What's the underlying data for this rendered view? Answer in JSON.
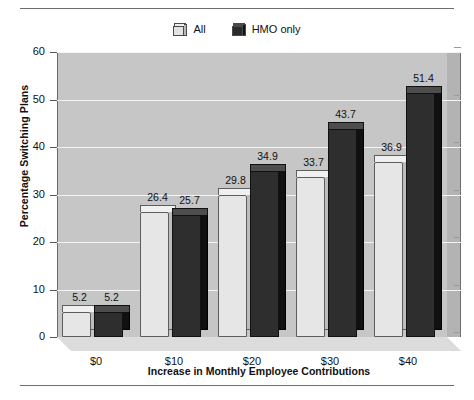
{
  "chart_data": {
    "type": "bar",
    "title": "",
    "xlabel": "Increase in Monthly Employee Contributions",
    "ylabel": "Percentage Switching Plans",
    "categories": [
      "$0",
      "$10",
      "$20",
      "$30",
      "$40"
    ],
    "series": [
      {
        "name": "All",
        "values": [
          5.2,
          26.4,
          29.8,
          33.7,
          36.9
        ],
        "color": "#e6e6e6"
      },
      {
        "name": "HMO only",
        "values": [
          5.2,
          25.7,
          34.9,
          43.7,
          51.4
        ],
        "color": "#2e2e2e"
      }
    ],
    "ylim": [
      0,
      60
    ],
    "yticks": [
      0,
      10,
      20,
      30,
      40,
      50,
      60
    ],
    "ytick_labels": [
      "0",
      "10",
      "20",
      "30",
      "40",
      "50",
      "60"
    ],
    "grid": true,
    "grid_axis": "y",
    "legend_position": "top-center",
    "data_labels": true,
    "style": "3d-bar",
    "plot_background": "#c6c6c6",
    "gridline_color": "#f4f4f4"
  },
  "legend": {
    "entries": [
      {
        "label": "All",
        "swatch": "light-gray-3d-box"
      },
      {
        "label": "HMO only",
        "swatch": "dark-3d-box"
      }
    ]
  },
  "axes": {
    "y_title": "Percentage Switching Plans",
    "x_title": "Increase in Monthly Employee Contributions"
  }
}
